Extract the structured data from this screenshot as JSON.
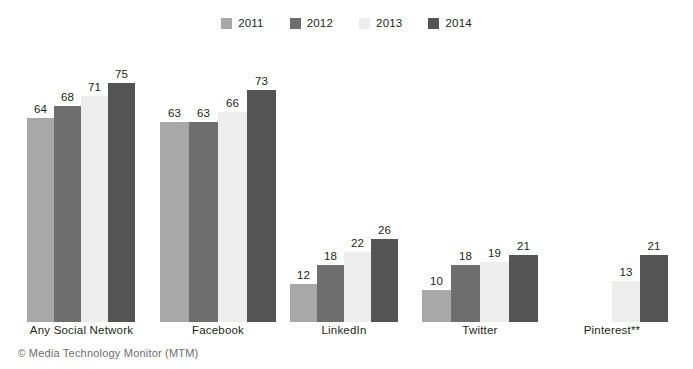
{
  "legend": {
    "items": [
      {
        "label": "2011",
        "color": "#a8a8a8"
      },
      {
        "label": "2012",
        "color": "#6e6e6e"
      },
      {
        "label": "2013",
        "color": "#ededed"
      },
      {
        "label": "2014",
        "color": "#545454"
      }
    ]
  },
  "footer": {
    "copyright_symbol": "©",
    "text": "Media Technology Monitor (MTM)"
  },
  "chart_data": {
    "type": "bar",
    "title": "",
    "xlabel": "",
    "ylabel": "",
    "ylim": [
      0,
      80
    ],
    "grid": false,
    "legend_position": "top-center",
    "categories": [
      "Any Social Network",
      "Facebook",
      "LinkedIn",
      "Twitter",
      "Pinterest**"
    ],
    "series": [
      {
        "name": "2011",
        "color": "#a8a8a8",
        "values": [
          64,
          63,
          12,
          10,
          null
        ]
      },
      {
        "name": "2012",
        "color": "#6e6e6e",
        "values": [
          68,
          63,
          18,
          18,
          null
        ]
      },
      {
        "name": "2013",
        "color": "#ededed",
        "values": [
          71,
          66,
          22,
          19,
          13
        ]
      },
      {
        "name": "2014",
        "color": "#545454",
        "values": [
          75,
          73,
          26,
          21,
          21
        ]
      }
    ],
    "groups": [
      {
        "label": "Any Social Network",
        "left": 27,
        "width": 109,
        "bar_width": 27,
        "bars": [
          {
            "year": "2011",
            "value": 64,
            "label": "64",
            "color": "#a8a8a8"
          },
          {
            "year": "2012",
            "value": 68,
            "label": "68",
            "color": "#6e6e6e"
          },
          {
            "year": "2013",
            "value": 71,
            "label": "71",
            "color": "#ededed"
          },
          {
            "year": "2014",
            "value": 75,
            "label": "75",
            "color": "#545454"
          }
        ]
      },
      {
        "label": "Facebook",
        "left": 160,
        "width": 116,
        "bar_width": 29,
        "bars": [
          {
            "year": "2011",
            "value": 63,
            "label": "63",
            "color": "#a8a8a8"
          },
          {
            "year": "2012",
            "value": 63,
            "label": "63",
            "color": "#6e6e6e"
          },
          {
            "year": "2013",
            "value": 66,
            "label": "66",
            "color": "#ededed"
          },
          {
            "year": "2014",
            "value": 73,
            "label": "73",
            "color": "#545454"
          }
        ]
      },
      {
        "label": "LinkedIn",
        "left": 290,
        "width": 108,
        "bar_width": 27,
        "bars": [
          {
            "year": "2011",
            "value": 12,
            "label": "12",
            "color": "#a8a8a8"
          },
          {
            "year": "2012",
            "value": 18,
            "label": "18",
            "color": "#6e6e6e"
          },
          {
            "year": "2013",
            "value": 22,
            "label": "22",
            "color": "#ededed"
          },
          {
            "year": "2014",
            "value": 26,
            "label": "26",
            "color": "#545454"
          }
        ]
      },
      {
        "label": "Twitter",
        "left": 422,
        "width": 116,
        "bar_width": 29,
        "bars": [
          {
            "year": "2011",
            "value": 10,
            "label": "10",
            "color": "#a8a8a8"
          },
          {
            "year": "2012",
            "value": 18,
            "label": "18",
            "color": "#6e6e6e"
          },
          {
            "year": "2013",
            "value": 19,
            "label": "19",
            "color": "#ededed"
          },
          {
            "year": "2014",
            "value": 21,
            "label": "21",
            "color": "#545454"
          }
        ]
      },
      {
        "label": "Pinterest**",
        "left": 556,
        "width": 112,
        "bar_width": 28,
        "bars": [
          {
            "year": "2011",
            "value": null,
            "label": "",
            "color": "#a8a8a8"
          },
          {
            "year": "2012",
            "value": null,
            "label": "",
            "color": "#6e6e6e"
          },
          {
            "year": "2013",
            "value": 13,
            "label": "13",
            "color": "#ededed"
          },
          {
            "year": "2014",
            "value": 21,
            "label": "21",
            "color": "#545454"
          }
        ]
      }
    ]
  }
}
